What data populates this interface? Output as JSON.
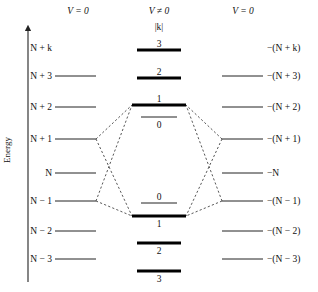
{
  "figure": {
    "axis": {
      "label": "Energy",
      "arrow_head": "up-arrow-icon"
    },
    "columns": {
      "left_header": "V = 0",
      "center_header": "V ≠ 0",
      "right_header": "V = 0",
      "center_subheader": "|k|"
    },
    "left_levels": [
      {
        "label": "N + k",
        "y": 48,
        "has_line": false
      },
      {
        "label": "N + 3",
        "y": 76,
        "has_line": true
      },
      {
        "label": "N + 2",
        "y": 107,
        "has_line": true
      },
      {
        "label": "N + 1",
        "y": 139,
        "has_line": true
      },
      {
        "label": "N",
        "y": 173,
        "has_line": true
      },
      {
        "label": "N − 1",
        "y": 201,
        "has_line": true
      },
      {
        "label": "N − 2",
        "y": 231,
        "has_line": true
      },
      {
        "label": "N − 3",
        "y": 259,
        "has_line": true
      }
    ],
    "right_levels": [
      {
        "label": "−(N + k)",
        "y": 48,
        "has_line": false
      },
      {
        "label": "−(N + 3)",
        "y": 76,
        "has_line": true
      },
      {
        "label": "−(N + 2)",
        "y": 107,
        "has_line": true
      },
      {
        "label": "−(N + 1)",
        "y": 139,
        "has_line": true
      },
      {
        "label": "−N",
        "y": 173,
        "has_line": true
      },
      {
        "label": "−(N − 1)",
        "y": 201,
        "has_line": true
      },
      {
        "label": "−(N − 2)",
        "y": 231,
        "has_line": true
      },
      {
        "label": "−(N − 3)",
        "y": 259,
        "has_line": true
      }
    ],
    "center_levels": [
      {
        "label": "3",
        "y": 50,
        "weight": "thick",
        "label_pos": "above",
        "half_width": 22
      },
      {
        "label": "2",
        "y": 78,
        "weight": "thick",
        "label_pos": "above",
        "half_width": 22
      },
      {
        "label": "1",
        "y": 105,
        "weight": "thick",
        "label_pos": "above",
        "half_width": 27
      },
      {
        "label": "0",
        "y": 117,
        "weight": "thin",
        "label_pos": "below",
        "half_width": 18
      },
      {
        "label": "0",
        "y": 203,
        "weight": "thin",
        "label_pos": "above",
        "half_width": 18
      },
      {
        "label": "1",
        "y": 216,
        "weight": "thick",
        "label_pos": "below",
        "half_width": 27
      },
      {
        "label": "2",
        "y": 243,
        "weight": "thick",
        "label_pos": "below",
        "half_width": 22
      },
      {
        "label": "3",
        "y": 271,
        "weight": "thick",
        "label_pos": "below",
        "half_width": 22
      }
    ],
    "geometry": {
      "axis_x": 28,
      "axis_top": 28,
      "axis_bottom": 282,
      "left_line_x1": 55,
      "left_line_x2": 96,
      "right_line_x1": 222,
      "right_line_x2": 263,
      "center_x": 159,
      "left_header_x": 78,
      "center_header_x": 159,
      "right_header_x": 243,
      "header_y": 14,
      "subheader_y": 30,
      "left_label_x": 52,
      "right_label_x": 267,
      "energy_label_x": 10,
      "energy_label_y": 150
    },
    "connectors": [
      {
        "name": "left-N+1-to-upper-band",
        "points": "96,139 132,105"
      },
      {
        "name": "left-N+1-to-lower-band",
        "points": "96,139 132,216"
      },
      {
        "name": "left-N-1-to-upper-band",
        "points": "96,201 132,105"
      },
      {
        "name": "left-N-1-to-lower-band",
        "points": "96,201 132,216"
      },
      {
        "name": "right-N+1-to-upper-band",
        "points": "222,139 186,105"
      },
      {
        "name": "right-N+1-to-lower-band",
        "points": "222,139 186,216"
      },
      {
        "name": "right-N-1-to-upper-band",
        "points": "222,201 186,105"
      },
      {
        "name": "right-N-1-to-lower-band",
        "points": "222,201 186,216"
      }
    ]
  }
}
